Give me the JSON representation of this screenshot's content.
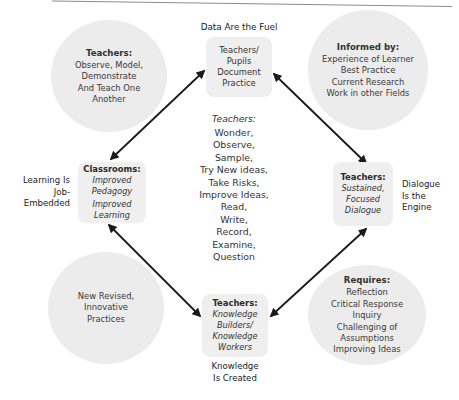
{
  "diagram": {
    "top_label": "Data Are the Fuel",
    "bottom_label": [
      "Knowledge",
      "Is Created"
    ],
    "left_label": [
      "Learning Is",
      "Job-",
      "Embedded"
    ],
    "right_label": [
      "Dialogue",
      "Is the",
      "Engine"
    ],
    "center": {
      "heading": "Teachers:",
      "items": [
        "Wonder,",
        "Observe,",
        "Sample,",
        "Try New ideas,",
        "Take Risks,",
        "Improve Ideas,",
        "Read,",
        "Write,",
        "Record,",
        "Examine,",
        "Question"
      ]
    },
    "boxes": {
      "top": {
        "lines": [
          "Teachers/",
          "Pupils",
          "Document",
          "Practice"
        ]
      },
      "left": {
        "heading": "Classrooms:",
        "italic_lines": [
          "Improved",
          "Pedagogy",
          "Improved",
          "Learning"
        ]
      },
      "right": {
        "heading": "Teachers:",
        "italic_lines": [
          "Sustained,",
          "Focused",
          "Dialogue"
        ]
      },
      "bottom": {
        "heading": "Teachers:",
        "italic_lines": [
          "Knowledge",
          "Builders/",
          "Knowledge",
          "Workers"
        ]
      }
    },
    "circles": {
      "top_left": {
        "heading": "Teachers:",
        "lines": [
          "Observe, Model,",
          "Demonstrate",
          "And Teach One",
          "Another"
        ]
      },
      "top_right": {
        "heading": "Informed by:",
        "lines": [
          "Experience of Learner",
          "Best Practice",
          "Current Research",
          "Work in other Fields"
        ]
      },
      "bottom_left": {
        "lines": [
          "New Revised,",
          "Innovative",
          "Practices"
        ]
      },
      "bottom_right": {
        "heading": "Requires:",
        "lines": [
          "Reflection",
          "Critical Response",
          "Inquiry",
          "Challenging of",
          "Assumptions",
          "Improving Ideas"
        ]
      }
    },
    "colors": {
      "circle_fill": "#ececec",
      "box_fill": "#efefef",
      "arrow": "#1a1a1a",
      "text": "#2a2a2a"
    }
  }
}
